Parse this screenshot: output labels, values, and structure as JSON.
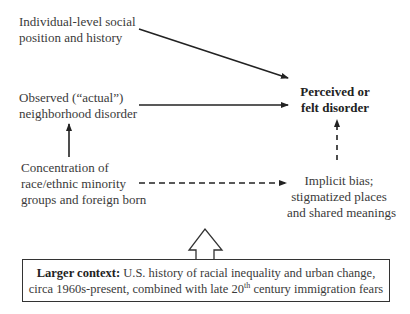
{
  "nodes": {
    "individual": {
      "line1": "Individual-level social",
      "line2": "position and history"
    },
    "observed": {
      "line1": "Observed (“actual”)",
      "line2": "neighborhood disorder"
    },
    "concentration": {
      "line1": "Concentration of",
      "line2": "race/ethnic minority",
      "line3": "groups and foreign born"
    },
    "perceived": {
      "line1": "Perceived or",
      "line2": "felt disorder"
    },
    "implicit": {
      "line1": "Implicit bias;",
      "line2": "stigmatized places",
      "line3": "and shared meanings"
    }
  },
  "context": {
    "label": "Larger context:",
    "line1_rest": " U.S. history of racial inequality and urban change,",
    "line2_pre": "circa 1960s-present, combined with late 20",
    "line2_sup": "th",
    "line2_post": " century immigration fears"
  },
  "edges": [
    {
      "from": "individual",
      "to": "perceived",
      "style": "solid"
    },
    {
      "from": "observed",
      "to": "perceived",
      "style": "solid"
    },
    {
      "from": "concentration",
      "to": "observed",
      "style": "solid"
    },
    {
      "from": "concentration",
      "to": "implicit",
      "style": "dashed"
    },
    {
      "from": "implicit",
      "to": "perceived",
      "style": "dashed"
    },
    {
      "from": "context",
      "to": "concentration/implicit",
      "style": "hollow-block-arrow"
    }
  ]
}
